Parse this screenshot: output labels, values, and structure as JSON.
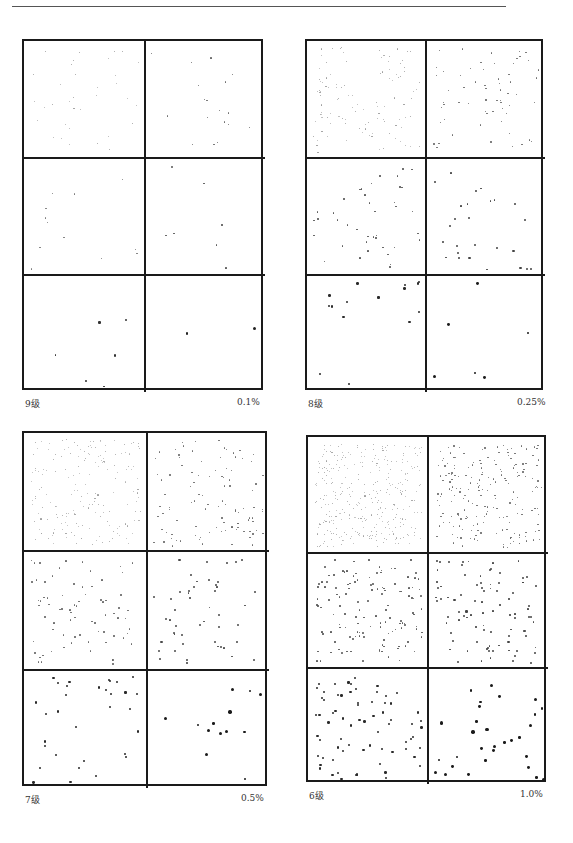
{
  "page": {
    "background": "#ffffff",
    "rule_color": "#555555",
    "ink_color": "#1a1a1a"
  },
  "panels": [
    {
      "level_label": "9级",
      "percent_label": "0.1%",
      "frame": {
        "x": 22,
        "y": 39,
        "w": 241,
        "h": 351
      },
      "caption_y": 397,
      "seed": 11,
      "rows": [
        [
          {
            "count": 34,
            "size": 1.0,
            "tone": "#9a9a9a"
          },
          {
            "count": 18,
            "size": 1.2,
            "tone": "#6a6a6a"
          }
        ],
        [
          {
            "count": 12,
            "size": 1.4,
            "tone": "#777777"
          },
          {
            "count": 7,
            "size": 1.8,
            "tone": "#555555"
          }
        ],
        [
          {
            "count": 6,
            "size": 2.0,
            "tone": "#333333"
          },
          {
            "count": 2,
            "size": 2.8,
            "tone": "#222222"
          }
        ]
      ]
    },
    {
      "level_label": "8级",
      "percent_label": "0.25%",
      "frame": {
        "x": 305,
        "y": 39,
        "w": 238,
        "h": 351
      },
      "caption_y": 397,
      "seed": 23,
      "rows": [
        [
          {
            "count": 110,
            "size": 1.0,
            "tone": "#9a9a9a"
          },
          {
            "count": 62,
            "size": 1.3,
            "tone": "#6a6a6a"
          }
        ],
        [
          {
            "count": 40,
            "size": 1.5,
            "tone": "#555555"
          },
          {
            "count": 26,
            "size": 1.9,
            "tone": "#444444"
          }
        ],
        [
          {
            "count": 15,
            "size": 2.2,
            "tone": "#2a2a2a"
          },
          {
            "count": 6,
            "size": 2.8,
            "tone": "#1a1a1a"
          }
        ]
      ]
    },
    {
      "level_label": "7级",
      "percent_label": "0.5%",
      "frame": {
        "x": 22,
        "y": 431,
        "w": 245,
        "h": 355
      },
      "caption_y": 793,
      "seed": 37,
      "rows": [
        [
          {
            "count": 180,
            "size": 1.0,
            "tone": "#a0a0a0"
          },
          {
            "count": 100,
            "size": 1.3,
            "tone": "#6a6a6a"
          }
        ],
        [
          {
            "count": 75,
            "size": 1.5,
            "tone": "#666666"
          },
          {
            "count": 48,
            "size": 1.9,
            "tone": "#4a4a4a"
          }
        ],
        [
          {
            "count": 32,
            "size": 2.2,
            "tone": "#2a2a2a"
          },
          {
            "count": 13,
            "size": 3.0,
            "tone": "#1a1a1a"
          }
        ]
      ]
    },
    {
      "level_label": "6级",
      "percent_label": "1.0%",
      "frame": {
        "x": 306,
        "y": 435,
        "w": 240,
        "h": 347
      },
      "caption_y": 789,
      "seed": 53,
      "rows": [
        [
          {
            "count": 330,
            "size": 1.0,
            "tone": "#a0a0a0"
          },
          {
            "count": 200,
            "size": 1.3,
            "tone": "#6a6a6a"
          }
        ],
        [
          {
            "count": 130,
            "size": 1.6,
            "tone": "#555555"
          },
          {
            "count": 90,
            "size": 1.9,
            "tone": "#444444"
          }
        ],
        [
          {
            "count": 70,
            "size": 2.3,
            "tone": "#2a2a2a"
          },
          {
            "count": 30,
            "size": 3.0,
            "tone": "#1a1a1a"
          }
        ]
      ]
    }
  ]
}
